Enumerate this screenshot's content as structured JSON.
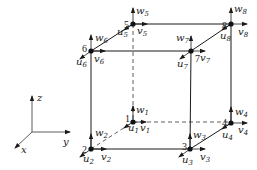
{
  "diagram": {
    "type": "hexahedral-element-node-dofs",
    "axes": {
      "x": "x",
      "y": "y",
      "z": "z"
    },
    "nodes": [
      {
        "id": "1",
        "u": "u",
        "v": "v",
        "w": "w",
        "sub": "1"
      },
      {
        "id": "2",
        "u": "u",
        "v": "v",
        "w": "w",
        "sub": "2"
      },
      {
        "id": "3",
        "u": "u",
        "v": "v",
        "w": "w",
        "sub": "3"
      },
      {
        "id": "4",
        "u": "u",
        "v": "v",
        "w": "w",
        "sub": "4"
      },
      {
        "id": "5",
        "u": "u",
        "v": "v",
        "w": "w",
        "sub": "5"
      },
      {
        "id": "6",
        "u": "u",
        "v": "v",
        "w": "w",
        "sub": "6"
      },
      {
        "id": "7",
        "u": "u",
        "v": "v",
        "w": "w",
        "sub": "7"
      },
      {
        "id": "8",
        "u": "u",
        "v": "v",
        "w": "w",
        "sub": "8"
      }
    ]
  }
}
